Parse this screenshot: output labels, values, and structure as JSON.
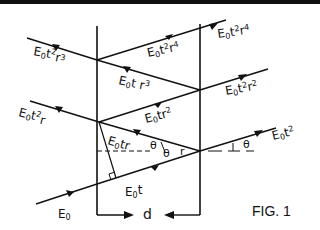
{
  "figure": {
    "caption": "FIG. 1",
    "thickness_label": "d",
    "angle_symbol": "θ",
    "refraction_angle_symbol": "r"
  },
  "rays": {
    "incident": {
      "base": "E",
      "sub": "0",
      "rest": ""
    },
    "inside_forward_1": {
      "base": "E",
      "sub": "0",
      "rest": "t"
    },
    "inside_back_1": {
      "base": "E",
      "sub": "0",
      "rest": "tr"
    },
    "transmitted_1": {
      "base": "E",
      "sub": "0",
      "rest": "t",
      "sup": "2"
    },
    "reflected_out_1": {
      "base": "E",
      "sub": "0",
      "rest": "t",
      "sup": "2",
      "tail": "r"
    },
    "inside_forward_2": {
      "base": "E",
      "sub": "0",
      "rest": "tr",
      "sup": "2"
    },
    "transmitted_2": {
      "base": "E",
      "sub": "0",
      "rest": "t",
      "sup": "2",
      "tail": "r",
      "tail_sup": "2"
    },
    "inside_back_2": {
      "base": "E",
      "sub": "0",
      "rest": "t r",
      "sup": "3"
    },
    "reflected_out_2": {
      "base": "E",
      "sub": "0",
      "rest": "t",
      "sup": "2",
      "tail": "r",
      "tail_sup": "3"
    },
    "inside_forward_3": {
      "base": "E",
      "sub": "0",
      "rest": "t",
      "sup": "2",
      "tail": "r",
      "tail_sup": "4"
    },
    "transmitted_3": {
      "base": "E",
      "sub": "0",
      "rest": "t",
      "sup": "2",
      "tail": "r",
      "tail_sup": "4"
    }
  },
  "colors": {
    "ink": "#111111",
    "background": "#ffffff"
  }
}
